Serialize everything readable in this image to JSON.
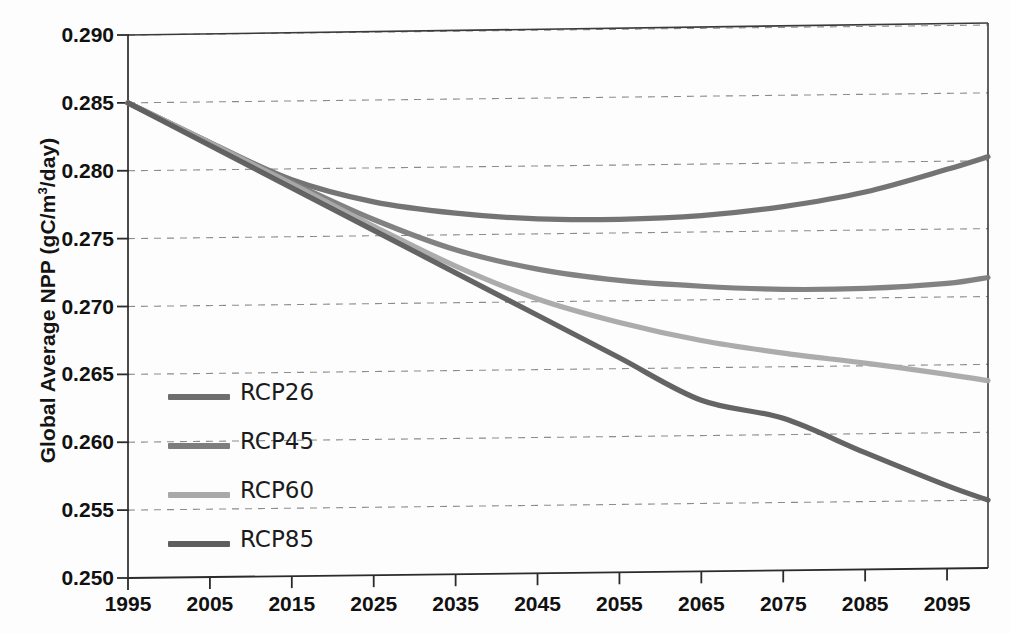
{
  "axes": {
    "ylabel_text": "Global Average NPP (gC/m",
    "ylabel_sup": "3",
    "ylabel_tail": "/day)",
    "yticks": [
      "0.250",
      "0.255",
      "0.260",
      "0.265",
      "0.270",
      "0.275",
      "0.280",
      "0.285",
      "0.290"
    ],
    "xticks": [
      "1995",
      "2005",
      "2015",
      "2025",
      "2035",
      "2045",
      "2055",
      "2065",
      "2075",
      "2085",
      "2095"
    ]
  },
  "legend": {
    "items": [
      {
        "label": "RCP26",
        "color": "#6e6e6e"
      },
      {
        "label": "RCP45",
        "color": "#7d7d7d"
      },
      {
        "label": "RCP60",
        "color": "#a9a9a9"
      },
      {
        "label": "RCP85",
        "color": "#5e5e5e"
      }
    ]
  },
  "chart_data": {
    "type": "line",
    "title": "",
    "xlabel": "",
    "ylabel": "Global Average NPP (gC/m3/day)",
    "xlim": [
      1995,
      2100
    ],
    "ylim": [
      0.25,
      0.29
    ],
    "ytick_values": [
      0.25,
      0.255,
      0.26,
      0.265,
      0.27,
      0.275,
      0.28,
      0.285,
      0.29
    ],
    "xtick_values": [
      1995,
      2005,
      2015,
      2025,
      2035,
      2045,
      2055,
      2065,
      2075,
      2085,
      2095
    ],
    "grid": "horizontal-dashed",
    "legend_position": "inner-left",
    "x": [
      1995,
      2005,
      2015,
      2025,
      2035,
      2045,
      2055,
      2065,
      2075,
      2085,
      2095,
      2100
    ],
    "series": [
      {
        "name": "RCP26",
        "color": "#6e6e6e",
        "values": [
          0.285,
          0.282,
          0.2792,
          0.2775,
          0.2766,
          0.2761,
          0.276,
          0.2762,
          0.2768,
          0.2778,
          0.2794,
          0.2803
        ]
      },
      {
        "name": "RCP45",
        "color": "#7d7d7d",
        "values": [
          0.285,
          0.282,
          0.279,
          0.2762,
          0.2739,
          0.2724,
          0.2715,
          0.271,
          0.2707,
          0.2707,
          0.271,
          0.2714
        ]
      },
      {
        "name": "RCP60",
        "color": "#a9a9a9",
        "values": [
          0.285,
          0.282,
          0.2789,
          0.2757,
          0.2727,
          0.2702,
          0.2684,
          0.267,
          0.266,
          0.2652,
          0.2643,
          0.2638
        ]
      },
      {
        "name": "RCP85",
        "color": "#5e5e5e",
        "values": [
          0.285,
          0.2818,
          0.2786,
          0.2754,
          0.2722,
          0.269,
          0.2658,
          0.2626,
          0.2612,
          0.2586,
          0.2561,
          0.255
        ]
      }
    ]
  }
}
